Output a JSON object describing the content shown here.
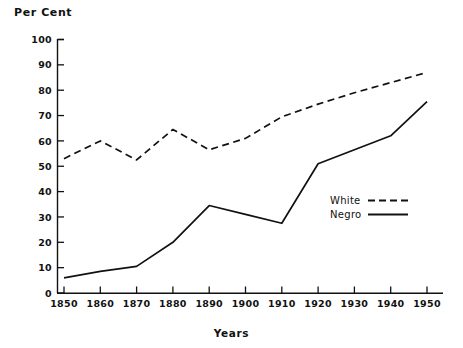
{
  "chart_data": {
    "type": "line",
    "title": "",
    "xlabel": "Years",
    "ylabel": "Per Cent",
    "x": [
      1850,
      1860,
      1870,
      1880,
      1890,
      1900,
      1910,
      1920,
      1930,
      1940,
      1950
    ],
    "xticklabels": [
      "1850",
      "1860",
      "1870",
      "1880",
      "1890",
      "1900",
      "1910",
      "1920",
      "1930",
      "1940",
      "1950"
    ],
    "yticklabels": [
      "0",
      "10",
      "20",
      "30",
      "40",
      "50",
      "60",
      "70",
      "80",
      "90",
      "100"
    ],
    "yticks": [
      0,
      10,
      20,
      30,
      40,
      50,
      60,
      70,
      80,
      90,
      100
    ],
    "xlim": [
      1850,
      1950
    ],
    "ylim": [
      0,
      100
    ],
    "grid": false,
    "legend_position": "center-right",
    "series": [
      {
        "name": "White",
        "style": "dashed",
        "color": "#111111",
        "values": [
          53,
          60,
          52.5,
          64.5,
          56.5,
          61,
          69.5,
          74.5,
          79,
          83,
          87
        ]
      },
      {
        "name": "Negro",
        "style": "solid",
        "color": "#111111",
        "values": [
          6,
          8.5,
          10.5,
          20,
          34.5,
          31,
          27.5,
          51,
          56.5,
          62,
          75.5
        ]
      }
    ]
  },
  "axes": {
    "y_axis_title": "Per Cent",
    "x_axis_title": "Years"
  },
  "legend": {
    "entries": [
      {
        "label": "White",
        "style": "dashed"
      },
      {
        "label": "Negro",
        "style": "solid"
      }
    ]
  }
}
